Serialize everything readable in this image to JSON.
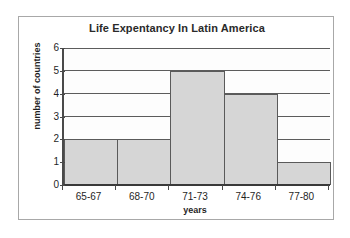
{
  "chart_data": {
    "type": "bar",
    "title": "Life Expentancy In Latin America",
    "xlabel": "years",
    "ylabel": "number of countries",
    "categories": [
      "65-67",
      "68-70",
      "71-73",
      "74-76",
      "77-80"
    ],
    "values": [
      2,
      2,
      5,
      4,
      1
    ],
    "ylim": [
      0,
      6
    ],
    "ytick_labels": [
      "0",
      "1",
      "2",
      "3",
      "4",
      "5",
      "6"
    ],
    "ytick_values": [
      0,
      1,
      2,
      3,
      4,
      5,
      6
    ],
    "grid": true,
    "legend": false,
    "bar_gap": 0,
    "colors": {
      "bar_fill": "#d6d6d6",
      "bar_border": "#5a5a5a",
      "gridline": "#5c5c5c",
      "axis": "#3a3a3a",
      "text": "#1f1f1f",
      "frame_border": "#a8a8a8",
      "plot_background": "#fdfdfd",
      "page_background": "#ffffff"
    }
  }
}
